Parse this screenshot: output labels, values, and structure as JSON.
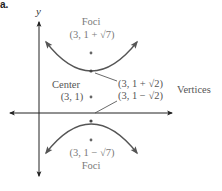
{
  "part_label": "a.",
  "axes": {
    "y_label": "y",
    "x_label": ""
  },
  "labels": {
    "foci_top_title": "Foci",
    "foci_top_coord": "(3, 1 + √7)",
    "center_title": "Center",
    "center_coord": "(3, 1)",
    "vertex_top_coord": "(3, 1 + √2)",
    "vertex_bottom_coord": "(3, 1 − √2)",
    "vertices_title": "Vertices",
    "foci_bottom_coord": "(3, 1 − √7)",
    "foci_bottom_title": "Foci"
  },
  "colors": {
    "curve": "#555555",
    "axis": "#222222",
    "text": "#7a7a7a"
  }
}
